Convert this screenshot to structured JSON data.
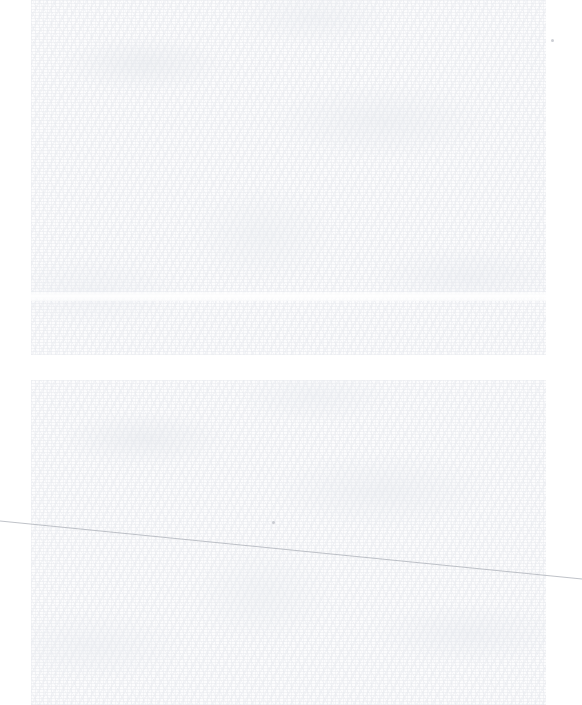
{
  "document": {
    "kind": "scanned-page",
    "width_px": 582,
    "height_px": 705,
    "background_color": "#ffffff",
    "paper_tone_color": "#fcfcfd",
    "texture_color": "#e8eaee",
    "legible_text": "",
    "note": ""
  },
  "scan_blocks": [
    {
      "name": "upper-scan-block",
      "x": 31,
      "y": 0,
      "width": 515,
      "height": 355,
      "label": ""
    },
    {
      "name": "lower-scan-block",
      "x": 31,
      "y": 380,
      "width": 515,
      "height": 325,
      "label": ""
    }
  ],
  "separator_gap": {
    "y": 355,
    "height": 25,
    "color": "#ffffff",
    "label": ""
  },
  "seam": {
    "y": 292,
    "height": 9,
    "label": ""
  },
  "margins": {
    "left_width": 31,
    "right_start": 546,
    "right_width": 36,
    "color": "#ffffff"
  },
  "hairline": {
    "name": "diagonal-hairline",
    "x1": 0,
    "y1": 521,
    "x2": 582,
    "y2": 579,
    "color": "#aeb2ba",
    "stroke_width": 0.8,
    "label": ""
  },
  "specks": [
    {
      "name": "dust-speck-1",
      "x": 552,
      "y": 40,
      "color": "#b9bcc4"
    },
    {
      "name": "dust-speck-2",
      "x": 273,
      "y": 522,
      "color": "#b9bcc4"
    }
  ]
}
